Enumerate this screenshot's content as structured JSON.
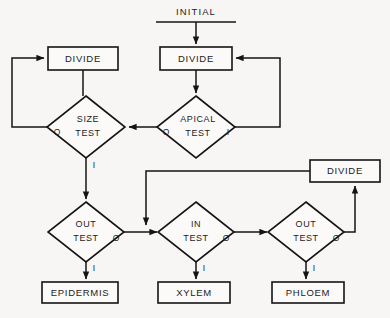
{
  "figure": {
    "type": "flowchart",
    "background_color": "#f7f6f4",
    "line_color": "#141414",
    "caption": ""
  },
  "entry": {
    "label": "INITIAL"
  },
  "nodes": {
    "divide_left": {
      "label": "DIVIDE",
      "shape": "rect",
      "x": 48,
      "y": 47,
      "w": 70,
      "h": 23
    },
    "divide_right": {
      "label": "DIVIDE",
      "shape": "rect",
      "x": 160,
      "y": 47,
      "w": 72,
      "h": 23
    },
    "divide_bottom": {
      "label": "DIVIDE",
      "shape": "rect",
      "x": 310,
      "y": 160,
      "w": 70,
      "h": 22
    },
    "size_test": {
      "label_line1": "SIZE",
      "label_line2": "TEST",
      "shape": "diamond",
      "cx": 86,
      "cy": 127,
      "rx": 39,
      "ry": 31
    },
    "apical_test": {
      "label_line1": "APICAL",
      "label_line2": "TEST",
      "shape": "diamond",
      "cx": 196,
      "cy": 127,
      "rx": 39,
      "ry": 31
    },
    "out_test_left": {
      "label_line1": "OUT",
      "label_line2": "TEST",
      "shape": "diamond",
      "cx": 86,
      "cy": 232,
      "rx": 38,
      "ry": 30
    },
    "in_test": {
      "label_line1": "IN",
      "label_line2": "TEST",
      "shape": "diamond",
      "cx": 196,
      "cy": 232,
      "rx": 38,
      "ry": 30
    },
    "out_test_right": {
      "label_line1": "OUT",
      "label_line2": "TEST",
      "shape": "diamond",
      "cx": 306,
      "cy": 232,
      "rx": 38,
      "ry": 30
    },
    "epidermis": {
      "label": "EPIDERMIS",
      "shape": "rect",
      "x": 42,
      "y": 282,
      "w": 76,
      "h": 21
    },
    "xylem": {
      "label": "XYLEM",
      "shape": "rect",
      "x": 158,
      "y": 282,
      "w": 72,
      "h": 21
    },
    "phloem": {
      "label": "PHLOEM",
      "shape": "rect",
      "x": 272,
      "y": 282,
      "w": 72,
      "h": 21
    }
  },
  "branch_labels": {
    "size_test_zero": "O",
    "size_test_one": "I",
    "apical_test_zero": "O",
    "apical_test_one": "I",
    "out_test_left_zero": "O",
    "out_test_left_one": "I",
    "in_test_zero": "O",
    "in_test_one": "I",
    "out_test_right_zero": "O",
    "out_test_right_one": "I"
  },
  "edges": [
    {
      "name": "initial-to-divide-right",
      "from": "INITIAL",
      "to": "divide_right",
      "arrow": true
    },
    {
      "name": "divide-right-to-apical",
      "from": "divide_right",
      "to": "apical_test",
      "arrow": true
    },
    {
      "name": "apical-one-to-divide-right",
      "from": "apical_test",
      "to": "divide_right",
      "label": "I",
      "arrow": true
    },
    {
      "name": "apical-zero-to-size",
      "from": "apical_test",
      "to": "size_test",
      "label": "O",
      "arrow": true
    },
    {
      "name": "divide-left-to-size",
      "from": "divide_left",
      "to": "size_test",
      "arrow": false
    },
    {
      "name": "size-zero-to-divide-left",
      "from": "size_test",
      "to": "divide_left",
      "label": "O",
      "arrow": true
    },
    {
      "name": "size-one-to-out-test-left",
      "from": "size_test",
      "to": "out_test_left",
      "label": "I",
      "arrow": true
    },
    {
      "name": "out-test-left-zero-to-in-test",
      "from": "out_test_left",
      "to": "in_test",
      "label": "O",
      "arrow": true
    },
    {
      "name": "out-test-left-one-to-epidermis",
      "from": "out_test_left",
      "to": "epidermis",
      "label": "I",
      "arrow": true
    },
    {
      "name": "in-test-zero-to-out-test-right",
      "from": "in_test",
      "to": "out_test_right",
      "label": "O",
      "arrow": true
    },
    {
      "name": "in-test-one-to-xylem",
      "from": "in_test",
      "to": "xylem",
      "label": "I",
      "arrow": true
    },
    {
      "name": "out-test-right-zero-to-divide-bottom",
      "from": "out_test_right",
      "to": "divide_bottom",
      "label": "O",
      "arrow": true
    },
    {
      "name": "out-test-right-one-to-phloem",
      "from": "out_test_right",
      "to": "phloem",
      "label": "I",
      "arrow": true
    },
    {
      "name": "divide-bottom-to-in-test",
      "from": "divide_bottom",
      "to": "in_test",
      "arrow": true
    }
  ]
}
